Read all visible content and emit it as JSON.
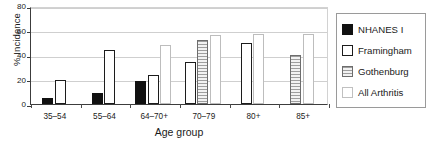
{
  "chart_data": {
    "type": "bar",
    "title": "",
    "xlabel": "Age group",
    "ylabel": "% Incidence",
    "categories": [
      "35–54",
      "55–64",
      "64–70+",
      "70–79",
      "80+",
      "85+"
    ],
    "ylim": [
      0,
      80
    ],
    "yticks": [
      0,
      20,
      40,
      60,
      80
    ],
    "ytick_labels": [
      "0",
      "20",
      "40",
      "60",
      "80"
    ],
    "grid": true,
    "legend_position": "right",
    "series": [
      {
        "name": "NHANES I",
        "key": "nhanes",
        "swatch": "solid-black",
        "values": [
          5,
          9,
          19,
          null,
          null,
          null
        ]
      },
      {
        "name": "Framingham",
        "key": "framingham",
        "swatch": "white-thick-border",
        "values": [
          20,
          44,
          24,
          34,
          50,
          null
        ]
      },
      {
        "name": "Gothenburg",
        "key": "gothenburg",
        "swatch": "horizontal-stripes",
        "values": [
          null,
          null,
          null,
          52,
          null,
          40
        ]
      },
      {
        "name": "All Arthritis",
        "key": "allarthritis",
        "swatch": "white-thin-border",
        "values": [
          null,
          null,
          48,
          56,
          57,
          57
        ]
      }
    ]
  },
  "colors": {
    "nhanes": "#111111",
    "framingham": "#ffffff",
    "gothenburg": "#9e9e9e",
    "allarthritis": "#ffffff",
    "axis": "#3c3c3c",
    "grid": "#cfcfcf"
  }
}
